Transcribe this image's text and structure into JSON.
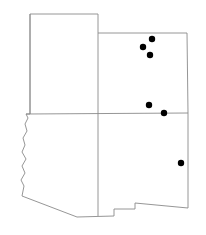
{
  "figure": {
    "kind": "dot-distribution-map",
    "region_label": "Southwestern United States",
    "background_color": "#ffffff",
    "outline_color": "#8a8a8a",
    "marker_color": "#000000",
    "marker_radius": 3.2,
    "canvas": {
      "width": 206,
      "height": 235
    }
  },
  "map": {
    "outline_path": "M 30,14 L 98,14 L 98,33 L 187,33 L 188,113 L 188,208 L 135,203 L 135,209 L 114,209 L 114,216 L 77,217 L 22,196 L 24,186 L 21,180 L 25,173 L 22,166 L 26,159 L 22,152 L 25,145 L 23,138 L 27,131 L 25,124 L 28,118 L 26,114 L 30,114 Z",
    "internal_borders": [
      {
        "id": "nevada-utah-line",
        "name": "utah-colorado-arizona-newmexico-vertical",
        "d": "M 98,33 L 98,216"
      },
      {
        "id": "four-corners-horizontal",
        "name": "utah-colorado-to-arizona-newmexico-horizontal",
        "d": "M 26,114 L 188,113"
      },
      {
        "id": "nevada-east-line",
        "name": "nevada-utah-vertical",
        "d": "M 30,14 L 30,114"
      }
    ],
    "notes": "Thin gray state boundary lines on white; five-state block (Nevada, Utah, Colorado, Arizona, New Mexico) with stepped bootheel along the southern edge and the jagged Colorado River border on the west."
  },
  "markers": [
    {
      "id": "site-1",
      "name": "site-marker-north-a",
      "x": 152,
      "y": 39
    },
    {
      "id": "site-2",
      "name": "site-marker-north-b",
      "x": 143,
      "y": 47
    },
    {
      "id": "site-3",
      "name": "site-marker-north-c",
      "x": 150,
      "y": 55
    },
    {
      "id": "site-4",
      "name": "site-marker-central-a",
      "x": 149,
      "y": 105
    },
    {
      "id": "site-5",
      "name": "site-marker-central-b",
      "x": 164,
      "y": 113
    },
    {
      "id": "site-6",
      "name": "site-marker-southeast",
      "x": 181,
      "y": 163
    }
  ]
}
